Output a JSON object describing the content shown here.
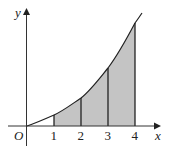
{
  "figure": {
    "axes": {
      "x_label": "x",
      "y_label": "y",
      "origin_label": "O"
    },
    "x_ticks": [
      {
        "value": 1,
        "label": "1"
      },
      {
        "value": 2,
        "label": "2"
      },
      {
        "value": 3,
        "label": "3"
      },
      {
        "value": 4,
        "label": "4"
      }
    ],
    "shaded_region": {
      "from": 1,
      "to": 4,
      "color": "#c4c4c4"
    },
    "strips": [
      1,
      2,
      3,
      4
    ],
    "curve_color": "#222222"
  }
}
